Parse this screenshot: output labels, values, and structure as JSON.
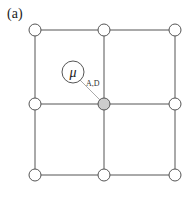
{
  "panel_label": "(a)",
  "lattice": {
    "rows": 3,
    "cols": 3,
    "node_x": [
      35,
      104,
      175
    ],
    "node_y": [
      30,
      104,
      175
    ],
    "highlighted_node": {
      "row": 1,
      "col": 1,
      "fill": "#cccccc"
    }
  },
  "mu_node": {
    "symbol": "μ",
    "cx": 73,
    "cy": 72,
    "r": 11
  },
  "edge_label": "A,D",
  "colors": {
    "line": "#555555",
    "node_fill": "#ffffff",
    "highlight": "#cccccc",
    "connector": "#aaaaaa"
  }
}
